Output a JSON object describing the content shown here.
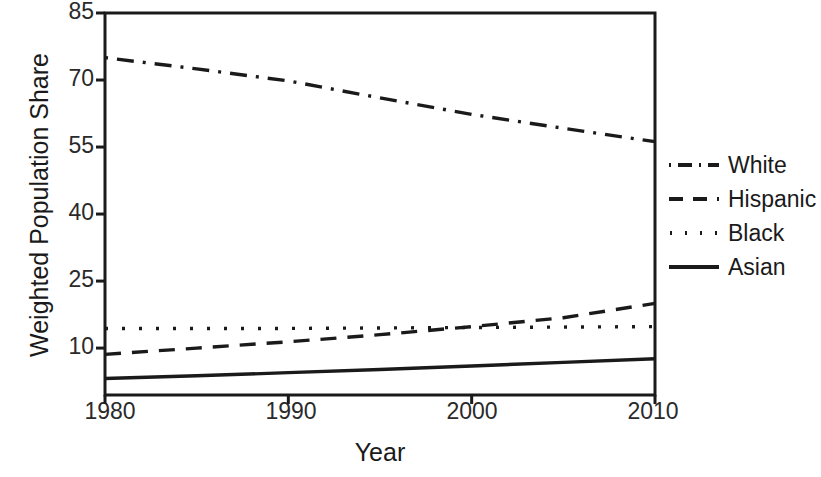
{
  "chart_data": {
    "type": "line",
    "title": "",
    "xlabel": "Year",
    "ylabel": "Weighted Population Share",
    "xlim": [
      1980,
      2010
    ],
    "ylim": [
      -0.5,
      85
    ],
    "xticks": [
      1980,
      1990,
      2000,
      2010
    ],
    "yticks": [
      10,
      25,
      40,
      55,
      70,
      85
    ],
    "grid": false,
    "legend_position": "right",
    "x": [
      1980,
      1985,
      1990,
      1995,
      2000,
      2005,
      2010
    ],
    "series": [
      {
        "name": "White",
        "style": "dash-dot",
        "values": [
          75.0,
          72.5,
          69.8,
          66.0,
          62.3,
          59.2,
          56.2
        ]
      },
      {
        "name": "Hispanic",
        "style": "dashed",
        "values": [
          8.6,
          10.0,
          11.4,
          13.0,
          14.8,
          16.8,
          20.0
        ]
      },
      {
        "name": "Black",
        "style": "dotted",
        "values": [
          14.4,
          14.4,
          14.4,
          14.5,
          14.6,
          14.7,
          14.8
        ]
      },
      {
        "name": "Asian",
        "style": "solid",
        "values": [
          3.2,
          3.8,
          4.5,
          5.2,
          6.0,
          6.8,
          7.6
        ]
      }
    ]
  },
  "axes": {
    "ytick_labels": [
      "85",
      "70",
      "55",
      "40",
      "25",
      "10"
    ],
    "xtick_labels": [
      "1980",
      "1990",
      "2000",
      "2010"
    ],
    "ylabel_text": "Weighted Population Share",
    "xlabel_text": "Year"
  },
  "legend": {
    "items": [
      {
        "label": "White",
        "style": "dash-dot"
      },
      {
        "label": "Hispanic",
        "style": "dashed"
      },
      {
        "label": "Black",
        "style": "dotted"
      },
      {
        "label": "Asian",
        "style": "solid"
      }
    ]
  },
  "colors": {
    "line": "#1a1a1a",
    "axis": "#1a1a1a",
    "background": "#ffffff",
    "text": "#1a1a1a"
  }
}
